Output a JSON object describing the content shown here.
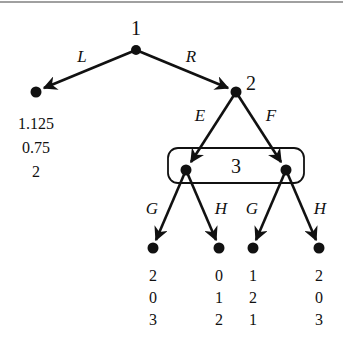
{
  "diagram": {
    "type": "extensive-form game tree",
    "nodes": [
      {
        "id": "root",
        "player": "1",
        "x": 136,
        "y": 50
      },
      {
        "id": "leafL",
        "x": 36,
        "y": 92,
        "payoffs": [
          "1.125",
          "0.75",
          "2"
        ]
      },
      {
        "id": "n2",
        "player": "2",
        "x": 236,
        "y": 92
      },
      {
        "id": "n3a",
        "x": 186,
        "y": 170
      },
      {
        "id": "n3b",
        "x": 286,
        "y": 170
      },
      {
        "id": "leafEG",
        "x": 153,
        "y": 248,
        "payoffs": [
          "2",
          "0",
          "3"
        ]
      },
      {
        "id": "leafEH",
        "x": 219,
        "y": 248,
        "payoffs": [
          "0",
          "1",
          "2"
        ]
      },
      {
        "id": "leafFG",
        "x": 253,
        "y": 248,
        "payoffs": [
          "1",
          "2",
          "1"
        ]
      },
      {
        "id": "leafFH",
        "x": 319,
        "y": 248,
        "payoffs": [
          "2",
          "0",
          "3"
        ]
      }
    ],
    "edges": [
      {
        "from": "root",
        "to": "leafL",
        "label": "L"
      },
      {
        "from": "root",
        "to": "n2",
        "label": "R"
      },
      {
        "from": "n2",
        "to": "n3a",
        "label": "E"
      },
      {
        "from": "n2",
        "to": "n3b",
        "label": "F"
      },
      {
        "from": "n3a",
        "to": "leafEG",
        "label": "G"
      },
      {
        "from": "n3a",
        "to": "leafEH",
        "label": "H"
      },
      {
        "from": "n3b",
        "to": "leafFG",
        "label": "G"
      },
      {
        "from": "n3b",
        "to": "leafFH",
        "label": "H"
      }
    ],
    "information_sets": [
      {
        "player": "3",
        "nodes": [
          "n3a",
          "n3b"
        ]
      }
    ],
    "labels": {
      "player1": "1",
      "player2": "2",
      "player3": "3",
      "L": "L",
      "R": "R",
      "E": "E",
      "F": "F",
      "G1": "G",
      "H1": "H",
      "G2": "G",
      "H2": "H"
    },
    "payoffs": {
      "leafL": [
        "1.125",
        "0.75",
        "2"
      ],
      "leafEG": [
        "2",
        "0",
        "3"
      ],
      "leafEH": [
        "0",
        "1",
        "2"
      ],
      "leafFG": [
        "1",
        "2",
        "1"
      ],
      "leafFH": [
        "2",
        "0",
        "3"
      ]
    }
  }
}
